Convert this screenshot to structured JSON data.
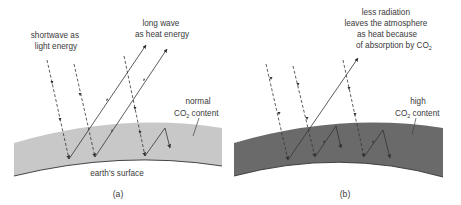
{
  "figure": {
    "panels": [
      {
        "id": "a",
        "caption": "(a)",
        "atmosphere_fill": "#c8c8c8",
        "labels": {
          "shortwave_line1": "shortwave as",
          "shortwave_line2": "light energy",
          "longwave_line1": "long wave",
          "longwave_line2": "as heat energy",
          "co2_line1": "normal",
          "co2_line2_prefix": "CO",
          "co2_line2_sub": "2",
          "co2_line2_suffix": " content",
          "surface": "earth's surface"
        }
      },
      {
        "id": "b",
        "caption": "(b)",
        "atmosphere_fill": "#6a6a6a",
        "labels": {
          "note_line1": "less radiation",
          "note_line2": "leaves the atmosphere",
          "note_line3": "as heat because",
          "note_line4_prefix": "of absorption by CO",
          "note_line4_sub": "2",
          "co2_line1": "high",
          "co2_line2_prefix": "CO",
          "co2_line2_sub": "2",
          "co2_line2_suffix": " content"
        }
      }
    ]
  }
}
